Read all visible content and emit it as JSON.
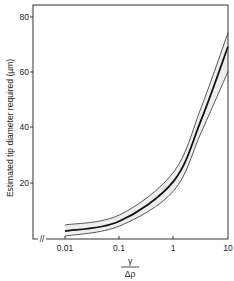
{
  "chart_data": {
    "type": "line",
    "title": "",
    "xlabel_num": "γ",
    "xlabel_den": "Δρ",
    "ylabel": "Estimated tip diameter required (µm)",
    "xscale": "log",
    "xlim": [
      0.01,
      10
    ],
    "ylim": [
      0,
      80
    ],
    "x_ticks": [
      "0.01",
      "0.1",
      "1",
      "10"
    ],
    "y_ticks": [
      "20",
      "40",
      "60",
      "80"
    ],
    "grid": false,
    "legend": null,
    "axis_break": "//",
    "x": [
      0.01,
      0.1,
      1,
      3.2,
      10
    ],
    "series": [
      {
        "name": "upper bound",
        "style": "thin",
        "values": [
          4.7,
          8.3,
          23.8,
          47,
          74
        ]
      },
      {
        "name": "estimate",
        "style": "thick",
        "values": [
          2.5,
          6.0,
          20.5,
          42.5,
          69
        ]
      },
      {
        "name": "lower bound",
        "style": "thin",
        "values": [
          0.7,
          4.3,
          17.0,
          38,
          60
        ]
      }
    ],
    "band_fill": "#cfcfcf"
  }
}
